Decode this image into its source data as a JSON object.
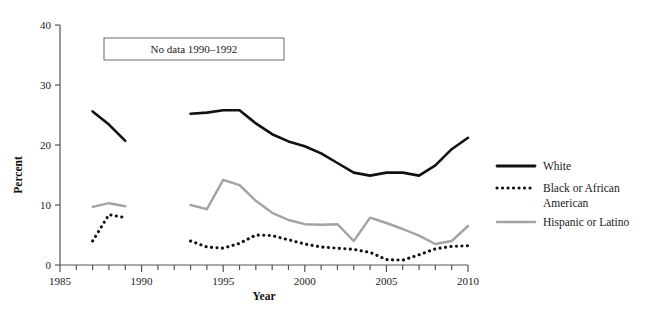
{
  "chart_data": {
    "type": "line",
    "title": "",
    "xlabel": "Year",
    "ylabel": "Percent",
    "xlim": [
      1985,
      2010
    ],
    "ylim": [
      0,
      40
    ],
    "yticks": [
      0,
      10,
      20,
      30,
      40
    ],
    "ytick_labels": [
      "0",
      "10",
      "20",
      "30",
      "40"
    ],
    "xticks": [
      1985,
      1990,
      1995,
      2000,
      2005,
      2010
    ],
    "xtick_labels": [
      "1985",
      "1990",
      "1995",
      "2000",
      "2005",
      "2010"
    ],
    "xtick_minor_step": 1,
    "grid": false,
    "legend_position": "right",
    "annotations": [
      {
        "text": "No data 1990–1992",
        "boxed": true
      }
    ],
    "series": [
      {
        "name": "White",
        "style": "solid",
        "color": "#111111",
        "segments": [
          {
            "x": [
              1987,
              1988,
              1989
            ],
            "y": [
              25.6,
              23.4,
              20.7
            ]
          },
          {
            "x": [
              1993,
              1994,
              1995,
              1996,
              1997,
              1998,
              1999,
              2000,
              2001,
              2002,
              2003,
              2004,
              2005,
              2006,
              2007,
              2008,
              2009,
              2010
            ],
            "y": [
              25.2,
              25.4,
              25.8,
              25.8,
              23.6,
              21.8,
              20.6,
              19.8,
              18.6,
              17.0,
              15.4,
              14.9,
              15.4,
              15.4,
              14.9,
              16.6,
              19.3,
              21.2
            ]
          }
        ]
      },
      {
        "name": "Black or African American",
        "style": "dotted",
        "color": "#111111",
        "segments": [
          {
            "x": [
              1987,
              1988,
              1989
            ],
            "y": [
              4.0,
              8.4,
              7.9
            ]
          },
          {
            "x": [
              1993,
              1994,
              1995,
              1996,
              1997,
              1998,
              1999,
              2000,
              2001,
              2002,
              2003,
              2004,
              2005,
              2006,
              2007,
              2008,
              2009,
              2010
            ],
            "y": [
              4.0,
              3.0,
              2.8,
              3.6,
              5.0,
              4.9,
              4.2,
              3.5,
              3.0,
              2.8,
              2.6,
              2.1,
              0.9,
              0.8,
              1.7,
              2.7,
              3.1,
              3.2
            ]
          }
        ]
      },
      {
        "name": "Hispanic or Latino",
        "style": "solid",
        "color": "#a3a3a3",
        "segments": [
          {
            "x": [
              1987,
              1988,
              1989
            ],
            "y": [
              9.7,
              10.3,
              9.8
            ]
          },
          {
            "x": [
              1993,
              1994,
              1995,
              1996,
              1997,
              1998,
              1999,
              2000,
              2001,
              2002,
              2003,
              2004,
              2005,
              2006,
              2007,
              2008,
              2009,
              2010
            ],
            "y": [
              10.0,
              9.3,
              14.2,
              13.3,
              10.7,
              8.7,
              7.5,
              6.8,
              6.7,
              6.8,
              4.0,
              7.9,
              7.0,
              6.0,
              4.9,
              3.5,
              4.0,
              6.5
            ]
          }
        ]
      }
    ]
  },
  "legend": {
    "items": [
      {
        "label": "White",
        "style": "solid",
        "color": "#111111"
      },
      {
        "label": "Black or African",
        "label2": "American",
        "style": "dotted",
        "color": "#111111"
      },
      {
        "label": "Hispanic or Latino",
        "style": "solid",
        "color": "#a3a3a3"
      }
    ]
  },
  "note": {
    "text": "No data 1990–1992"
  },
  "axes": {
    "y_title": "Percent",
    "x_title": "Year",
    "y_labels": [
      "40",
      "30",
      "20",
      "10",
      "0"
    ],
    "x_labels": [
      "1985",
      "1990",
      "1995",
      "2000",
      "2005",
      "2010"
    ]
  }
}
